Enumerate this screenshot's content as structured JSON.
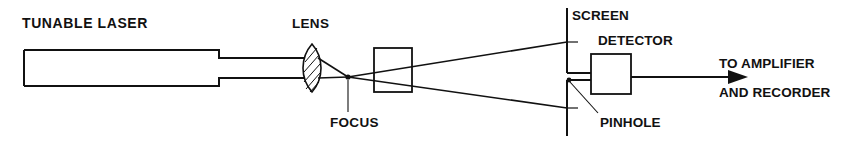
{
  "figure": {
    "width": 846,
    "height": 143,
    "background_color": "#ffffff",
    "ink_color": "#111111",
    "caption": ""
  },
  "labels": {
    "laser": "TUNABLE LASER",
    "lens": "LENS",
    "focus": "FOCUS",
    "screen": "SCREEN",
    "detector": "DETECTOR",
    "pinhole": "PINHOLE",
    "output_line1": "TO AMPLIFIER",
    "output_line2": "AND RECORDER"
  },
  "components": [
    {
      "name": "tunable-laser",
      "label": "TUNABLE LASER",
      "type": "source-body",
      "x": 24,
      "y": 50,
      "width": 195,
      "height": 36
    },
    {
      "name": "lens",
      "label": "LENS",
      "type": "biconvex-lens",
      "center_x": 312,
      "center_y": 68,
      "half_width": 8,
      "half_height": 24
    },
    {
      "name": "focus-point",
      "label": "FOCUS",
      "type": "point",
      "x": 348,
      "y": 77
    },
    {
      "name": "sample-cell",
      "label": "",
      "type": "rectangular-cell",
      "x": 374,
      "y": 48,
      "width": 38,
      "height": 44
    },
    {
      "name": "screen",
      "label": "SCREEN",
      "type": "aperture-screen",
      "x": 567,
      "top_y": 8,
      "gap_top_y": 73,
      "gap_bottom_y": 80,
      "bottom_y": 136
    },
    {
      "name": "pinhole",
      "label": "PINHOLE",
      "type": "aperture",
      "x": 567,
      "y": 80
    },
    {
      "name": "detector",
      "label": "DETECTOR",
      "type": "rectangular-box",
      "x": 591,
      "y": 54,
      "width": 40,
      "height": 40
    },
    {
      "name": "output-arrow",
      "label": "TO AMPLIFIER AND RECORDER",
      "type": "signal-arrow",
      "from_x": 631,
      "to_x": 738,
      "y": 77
    }
  ],
  "beam": {
    "collimated_top_y": 58,
    "collimated_bottom_y": 78,
    "collimated_from_x": 219,
    "collimated_to_x": 305,
    "focus_x": 348,
    "focus_y": 77,
    "screen_hit_top_y": 42,
    "screen_hit_bottom_y": 108,
    "screen_x": 567
  },
  "label_positions": {
    "laser": {
      "x": 22,
      "y": 28
    },
    "lens": {
      "x": 292,
      "y": 28
    },
    "focus": {
      "x": 330,
      "y": 127
    },
    "screen": {
      "x": 572,
      "y": 20
    },
    "detector": {
      "x": 598,
      "y": 45
    },
    "pinhole": {
      "x": 600,
      "y": 127
    },
    "output1": {
      "x": 719,
      "y": 68
    },
    "output2": {
      "x": 719,
      "y": 97
    }
  }
}
